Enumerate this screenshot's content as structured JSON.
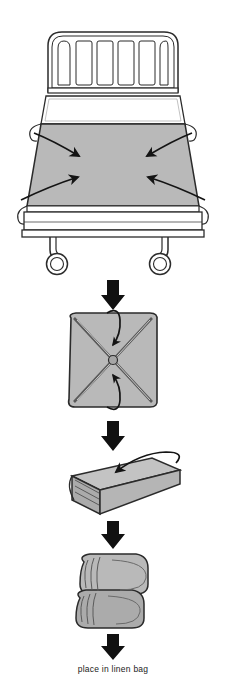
{
  "document": {
    "title": "Linen Folding Instruction Diagram",
    "background_color": "#ffffff",
    "width": 226,
    "height": 682
  },
  "palette": {
    "linen_gray": "#b9b9b9",
    "linen_gray_shade": "#a6a6a6",
    "linen_gray_light": "#c9c9c9",
    "outline": "#2b2b2b",
    "arrow_black": "#111111",
    "white": "#ffffff",
    "text": "#1a1a1a"
  },
  "steps": [
    {
      "id": "step-1",
      "name": "bed-with-soiled-linen",
      "description": "Hospital bed with headboard, pillow and gray sheet; four curved arrows gather the sheet corners toward the center",
      "arrow_count": 4,
      "headboard_bar_count": 6,
      "caster_count": 2
    },
    {
      "id": "step-2",
      "name": "bundled-square",
      "description": "Gathered linen folded into a square with diagonal X fold lines; two hooked arrows tuck corners to center",
      "fold_lines": 2,
      "tuck_arrow_count": 2
    },
    {
      "id": "step-3",
      "name": "folded-rectangle",
      "description": "Square folded into a flat rectangular bundle with layered edges; curved arrow indicates fold direction",
      "tuck_arrow_count": 1
    },
    {
      "id": "step-4",
      "name": "final-doubled-bundle",
      "description": "Rectangle folded in half into a compact doubled bundle ready for disposal"
    }
  ],
  "flow_arrows": [
    {
      "id": "flow-arrow-1",
      "between": "step-1 to step-2"
    },
    {
      "id": "flow-arrow-2",
      "between": "step-2 to step-3"
    },
    {
      "id": "flow-arrow-3",
      "between": "step-3 to step-4"
    },
    {
      "id": "flow-arrow-4",
      "between": "step-4 to caption"
    }
  ],
  "caption": {
    "text": "place in linen bag"
  }
}
